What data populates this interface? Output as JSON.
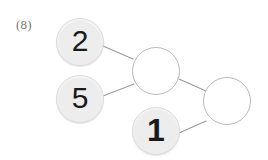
{
  "page": {
    "background_color": "#ffffff",
    "width": 268,
    "height": 160
  },
  "worksheet": {
    "item_number": "(8)",
    "type": "number-bond-chain"
  },
  "colors": {
    "filled_node_fill": "#ededed",
    "filled_node_stroke": "#dcdcdc",
    "empty_node_fill": "#ffffff",
    "empty_node_stroke": "#b9b9b9",
    "connector_stroke": "#9a9a9a",
    "digit_color": "#1a1a1a",
    "label_color": "#7a7a7a"
  },
  "nodes": [
    {
      "id": "node-2",
      "value": "2",
      "state": "filled",
      "has_value": true,
      "cx": 80,
      "cy": 42,
      "r": 24
    },
    {
      "id": "node-5",
      "value": "5",
      "state": "filled",
      "has_value": true,
      "cx": 80,
      "cy": 99,
      "r": 24
    },
    {
      "id": "node-sum-1",
      "value": "",
      "state": "empty",
      "has_value": false,
      "cx": 156,
      "cy": 71,
      "r": 24
    },
    {
      "id": "node-1",
      "value": "1",
      "state": "filled",
      "has_value": true,
      "cx": 156,
      "cy": 131,
      "r": 24
    },
    {
      "id": "node-sum-2",
      "value": "",
      "state": "empty",
      "has_value": false,
      "cx": 227,
      "cy": 101,
      "r": 24
    }
  ],
  "connectors": [
    {
      "id": "connector-2-to-sum1",
      "from": "node-2",
      "to": "node-sum-1",
      "x1": 103,
      "y1": 46,
      "x2": 133,
      "y2": 59
    },
    {
      "id": "connector-5-to-sum1",
      "from": "node-5",
      "to": "node-sum-1",
      "x1": 103,
      "y1": 96,
      "x2": 134,
      "y2": 84
    },
    {
      "id": "connector-sum1-to-sum2",
      "from": "node-sum-1",
      "to": "node-sum-2",
      "x1": 179,
      "y1": 79,
      "x2": 206,
      "y2": 91
    },
    {
      "id": "connector-1-to-sum2",
      "from": "node-1",
      "to": "node-sum-2",
      "x1": 179,
      "y1": 133,
      "x2": 206,
      "y2": 121
    }
  ]
}
